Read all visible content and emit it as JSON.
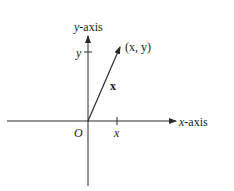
{
  "diagram": {
    "title": "",
    "axes": {
      "x_label_var": "x",
      "x_label_suffix": "-axis",
      "y_label_var": "y",
      "y_label_suffix": "-axis"
    },
    "origin_label": "O",
    "x_tick_label": "x",
    "y_tick_label": "y",
    "point_label": "(x, y)",
    "vector_label": "x",
    "colors": {
      "line": "#2a2a2a",
      "background": "#ffffff"
    }
  }
}
